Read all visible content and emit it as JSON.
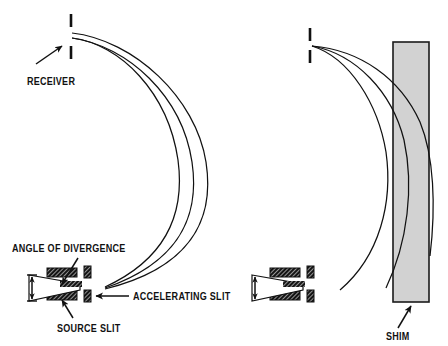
{
  "figure": {
    "title": "",
    "background_color": "#ffffff",
    "ink_color": "#111111",
    "shim_fill_color": "#d2d2d2",
    "width": 448,
    "height": 346
  },
  "labels": {
    "receiver": "RECEIVER",
    "angle_of_divergence": "ANGLE OF DIVERGENCE",
    "accelerating_slit": "ACCELERATING SLIT",
    "source_slit": "SOURCE SLIT",
    "shim": "SHIM"
  },
  "panels": [
    {
      "name": "without-shim",
      "has_shim": false,
      "receiver": {
        "x": 71,
        "tick_upper_y": [
          14,
          27
        ],
        "tick_lower_y": [
          46,
          59
        ]
      },
      "source": {
        "x": 60,
        "y": 288
      },
      "trajectories": 3
    },
    {
      "name": "with-shim",
      "has_shim": true,
      "receiver": {
        "x": 310,
        "tick_upper_y": [
          28,
          41
        ],
        "tick_lower_y": [
          50,
          63
        ]
      },
      "source": {
        "x": 283,
        "y": 288
      },
      "trajectories": 3,
      "shim": {
        "x": 393,
        "y": 42,
        "width": 36,
        "height": 260
      }
    }
  ],
  "icons": {
    "arrow": "arrow-icon",
    "slit_plate": "hatched-plate-icon",
    "divergence_bracket": "double-arrow-bracket-icon"
  }
}
